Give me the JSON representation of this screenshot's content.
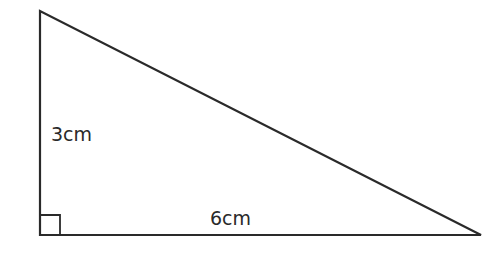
{
  "diagram": {
    "type": "right-triangle",
    "stroke_color": "#2a2a2a",
    "vertices": {
      "top": [
        40,
        11
      ],
      "right_angle": [
        40,
        235
      ],
      "right": [
        481,
        235
      ]
    },
    "labels": {
      "height": "3cm",
      "base": "6cm"
    },
    "right_angle_marker": true
  }
}
